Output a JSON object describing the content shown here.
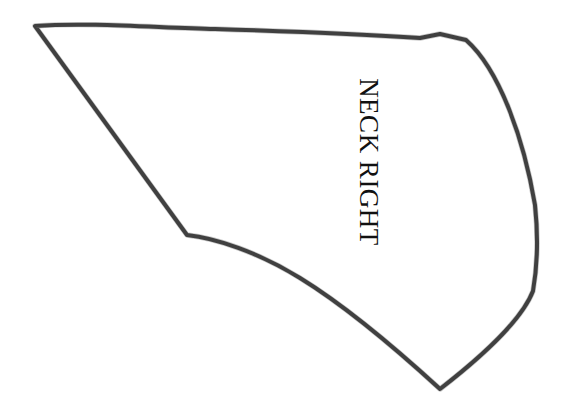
{
  "canvas": {
    "width": 569,
    "height": 420,
    "background_color": "#ffffff",
    "description": "Hand-drawn pattern piece outline on plain white paper"
  },
  "drawing": {
    "name": "neck-right-pattern-piece",
    "stroke_color": "#3d3d3d",
    "stroke_width": 4,
    "fill": "none",
    "style": "hand-drawn marker outline, closed shape",
    "outline_path": "M 35 26 C 90 22 160 28 215 29 C 280 31 360 34 420 38 L 440 34 L 466 40 C 500 70 524 140 535 205 C 539 243 537 268 533 291 C 521 322 480 358 440 389 C 404 356 352 310 300 278 C 258 252 215 238 187 235 L 35 26 Z",
    "vertices": [
      {
        "name": "top-left-corner",
        "x": 35,
        "y": 26
      },
      {
        "name": "top-notch",
        "x": 440,
        "y": 34
      },
      {
        "name": "top-right-corner",
        "x": 466,
        "y": 40
      },
      {
        "name": "right-widest-point",
        "x": 536,
        "y": 240
      },
      {
        "name": "right-kink",
        "x": 533,
        "y": 291
      },
      {
        "name": "bottom-vertex",
        "x": 440,
        "y": 389
      },
      {
        "name": "left-vertex",
        "x": 187,
        "y": 235
      }
    ],
    "edges": [
      {
        "name": "top-edge",
        "type": "near-straight-wavy",
        "from": "top-left-corner",
        "to": "top-right-corner"
      },
      {
        "name": "right-edge",
        "type": "convex-curve",
        "from": "top-right-corner",
        "to": "right-kink"
      },
      {
        "name": "lower-right-edge",
        "type": "straight",
        "from": "right-kink",
        "to": "bottom-vertex"
      },
      {
        "name": "bottom-curve-edge",
        "type": "concave-curve",
        "from": "bottom-vertex",
        "to": "left-vertex"
      },
      {
        "name": "left-diagonal-edge",
        "type": "straight",
        "from": "left-vertex",
        "to": "top-left-corner"
      }
    ]
  },
  "label": {
    "text": "NECK RIGHT",
    "rotation_degrees": 90,
    "color": "#111111",
    "font_size_px": 27,
    "center_x": 368,
    "center_y": 162
  }
}
